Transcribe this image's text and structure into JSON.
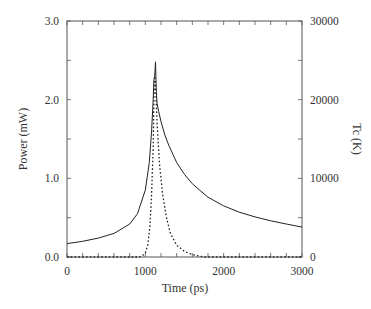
{
  "chart_data": {
    "type": "line",
    "title": "",
    "xlabel": "Time (ps)",
    "ylabel": "Power (mW)",
    "y2label": "Tc (K)",
    "xlim": [
      0,
      3000
    ],
    "ylim": [
      0.0,
      3.0
    ],
    "y2lim": [
      0,
      30000
    ],
    "x_ticks": [
      "0",
      "1000",
      "2000",
      "3000"
    ],
    "y_ticks": [
      "0.0",
      "1.0",
      "2.0",
      "3.0"
    ],
    "y2_ticks": [
      "0",
      "10000",
      "20000",
      "30000"
    ],
    "grid": false,
    "legend": null,
    "series": [
      {
        "name": "Power",
        "axis": "left",
        "style": "solid",
        "x": [
          0,
          200,
          400,
          600,
          800,
          900,
          1000,
          1050,
          1080,
          1100,
          1110,
          1120,
          1130,
          1135,
          1140,
          1150,
          1170,
          1200,
          1250,
          1300,
          1400,
          1500,
          1600,
          1800,
          2000,
          2200,
          2400,
          2600,
          2800,
          3000
        ],
        "values": [
          0.17,
          0.2,
          0.24,
          0.3,
          0.42,
          0.55,
          0.85,
          1.2,
          1.6,
          2.0,
          2.25,
          2.3,
          2.48,
          2.3,
          2.1,
          1.95,
          1.85,
          1.72,
          1.55,
          1.42,
          1.2,
          1.05,
          0.93,
          0.76,
          0.65,
          0.57,
          0.51,
          0.46,
          0.42,
          0.38
        ]
      },
      {
        "name": "Tc",
        "axis": "right",
        "style": "dashed",
        "x": [
          0,
          900,
          950,
          1000,
          1030,
          1060,
          1080,
          1100,
          1110,
          1120,
          1130,
          1150,
          1180,
          1220,
          1270,
          1320,
          1400,
          1500,
          1600,
          1700,
          1750,
          3000
        ],
        "values": [
          0,
          0,
          50,
          500,
          1500,
          4000,
          8000,
          14000,
          20000,
          23000,
          22000,
          17000,
          12000,
          8000,
          5000,
          3000,
          1500,
          700,
          300,
          100,
          0,
          0
        ]
      }
    ]
  }
}
